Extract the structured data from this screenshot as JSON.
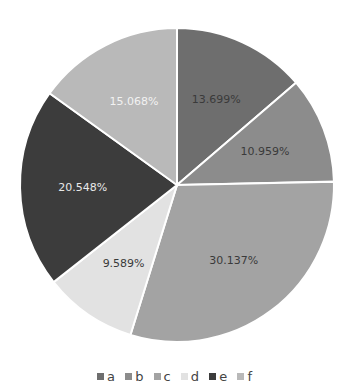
{
  "chart_data": {
    "type": "pie",
    "title": "",
    "categories": [
      "a",
      "b",
      "c",
      "d",
      "e",
      "f"
    ],
    "values": [
      13.699,
      10.959,
      30.137,
      9.589,
      20.548,
      15.068
    ],
    "labels": [
      "13.699%",
      "10.959%",
      "30.137%",
      "9.589%",
      "20.548%",
      "15.068%"
    ],
    "colors": [
      "#6e6e6e",
      "#8c8c8c",
      "#a3a3a3",
      "#e2e2e2",
      "#3c3c3c",
      "#b9b9b9"
    ],
    "label_colors": [
      "#3a3a3a",
      "#3a3a3a",
      "#3a3a3a",
      "#3a3a3a",
      "#e8e8e8",
      "#f2f2f2"
    ],
    "start_angle": "12 o'clock",
    "direction": "clockwise",
    "legend_position": "bottom"
  },
  "legend": {
    "items": [
      {
        "label": "a",
        "color": "#6e6e6e"
      },
      {
        "label": "b",
        "color": "#8c8c8c"
      },
      {
        "label": "c",
        "color": "#a3a3a3"
      },
      {
        "label": "d",
        "color": "#e2e2e2"
      },
      {
        "label": "e",
        "color": "#3c3c3c"
      },
      {
        "label": "f",
        "color": "#b9b9b9"
      }
    ]
  }
}
